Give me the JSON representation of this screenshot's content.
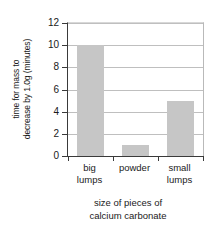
{
  "chart_data": {
    "type": "bar",
    "title": "",
    "categories": [
      "big lumps",
      "powder",
      "small lumps"
    ],
    "category_lines": [
      [
        "big",
        "lumps"
      ],
      [
        "powder",
        ""
      ],
      [
        "small",
        "lumps"
      ]
    ],
    "values": [
      10,
      1,
      5
    ],
    "xlabel": "size of pieces of calcium carbonate",
    "xlabel_lines": [
      "size of pieces of",
      "calcium carbonate"
    ],
    "ylabel": "time for mass to decrease by 1.0g (minutes)",
    "ylabel_lines": [
      "time for mass to",
      "decrease by 1.0g (minutes)"
    ],
    "ylim": [
      0,
      12
    ],
    "ytick_values": [
      0,
      2,
      4,
      6,
      8,
      10,
      12
    ],
    "ytick_labels": [
      "0",
      "2",
      "4",
      "6",
      "8",
      "10",
      "12"
    ],
    "grid": true,
    "grid_axis": "y",
    "legend": false,
    "legend_position": "none",
    "bar_color": "#c6c6c6",
    "axis_color": "#3a3a3a",
    "gridline_color": "#bfbfbf",
    "background_color": "#ffffff",
    "text_color": "#1a1a1a"
  }
}
